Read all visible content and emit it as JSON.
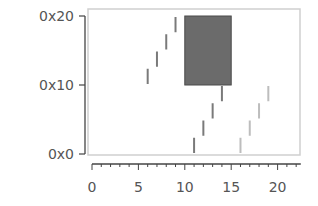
{
  "chart_data": {
    "type": "bar",
    "subtype": "range-segments",
    "title": "",
    "xlabel": "",
    "ylabel": "",
    "xlim": [
      -0.2,
      22.5
    ],
    "ylim": [
      0,
      32
    ],
    "grid": false,
    "legend": null,
    "x_ticks": [
      0,
      5,
      10,
      15,
      20
    ],
    "x_tick_labels": [
      "0",
      "5",
      "10",
      "15",
      "20"
    ],
    "x_minor_step": 1,
    "y_ticks": [
      0,
      16,
      32
    ],
    "y_tick_labels": [
      "0x0",
      "0x10",
      "0x20"
    ],
    "rectangle": {
      "x0": 10,
      "x1": 15,
      "y0": 16,
      "y1": 32,
      "color": "#6b6b6b",
      "edge": "#4a4a4a"
    },
    "series": [
      {
        "name": "segments-dark-upper",
        "color": "#7a7a7a",
        "segments": [
          {
            "x": 6,
            "y0": 16,
            "y1": 20
          },
          {
            "x": 7,
            "y0": 20,
            "y1": 24
          },
          {
            "x": 8,
            "y0": 24,
            "y1": 28
          },
          {
            "x": 9,
            "y0": 28,
            "y1": 32
          }
        ]
      },
      {
        "name": "segments-dark-lower",
        "color": "#7a7a7a",
        "segments": [
          {
            "x": 11,
            "y0": 0,
            "y1": 4
          },
          {
            "x": 12,
            "y0": 4,
            "y1": 8
          },
          {
            "x": 13,
            "y0": 8,
            "y1": 12
          },
          {
            "x": 14,
            "y0": 12,
            "y1": 16
          }
        ]
      },
      {
        "name": "segments-light",
        "color": "#bdbdbd",
        "segments": [
          {
            "x": 16,
            "y0": 0,
            "y1": 4
          },
          {
            "x": 17,
            "y0": 4,
            "y1": 8
          },
          {
            "x": 18,
            "y0": 8,
            "y1": 12
          },
          {
            "x": 19,
            "y0": 12,
            "y1": 16
          }
        ]
      }
    ]
  }
}
